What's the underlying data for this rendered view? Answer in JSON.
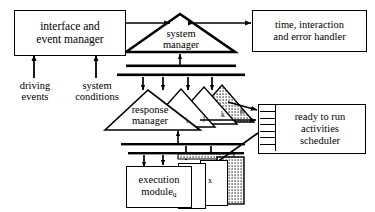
{
  "diagram": {
    "nodes": {
      "interface_event_manager": {
        "line1": "interface and",
        "line2": "event manager"
      },
      "time_error_handler": {
        "line1": "time, interaction",
        "line2": "and error handler"
      },
      "system_manager": {
        "line1": "system",
        "line2": "manager"
      },
      "response_manager": {
        "line1": "response",
        "line2": "manager"
      },
      "execution_module": {
        "line1": "execution",
        "line2": "module",
        "sub": "u"
      },
      "scheduler": {
        "line1": "ready to run",
        "line2": "activities",
        "line3": "scheduler"
      }
    },
    "inputs": {
      "driving_events": {
        "line1": "driving",
        "line2": "events"
      },
      "system_conditions": {
        "line1": "system",
        "line2": "conditions"
      }
    },
    "response_manager_instances": [
      "i",
      "j",
      "k",
      "n"
    ],
    "execution_module_instances": [
      "u",
      "v",
      "x",
      "w"
    ],
    "scheduler_queue_slots": 7,
    "colors": {
      "stroke": "#000000",
      "fill": "#ffffff",
      "shaded": "#cfcfcf",
      "background": "#ffffff"
    }
  }
}
